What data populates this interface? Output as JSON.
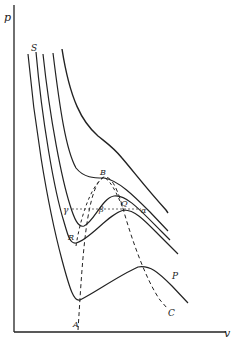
{
  "figure": {
    "axes": {
      "y_label": "p",
      "x_label": "v"
    },
    "point_labels": {
      "S": "S",
      "B": "B",
      "Q": "Q",
      "beta": "β",
      "alpha": "α",
      "gamma": "γ",
      "R": "R",
      "P": "P",
      "A": "A",
      "C": "C"
    },
    "colors": {
      "line": "#222222",
      "background": "#ffffff"
    }
  }
}
